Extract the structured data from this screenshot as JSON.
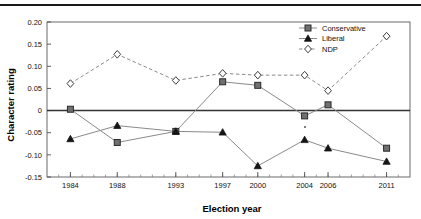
{
  "chart_data": {
    "type": "line",
    "title": "",
    "xlabel": "Election year",
    "ylabel": "Character rating",
    "categories": [
      1984,
      1988,
      1993,
      1997,
      2000,
      2004,
      2006,
      2011
    ],
    "xtick_labels": [
      "1984",
      "1988",
      "1993",
      "1997",
      "2000",
      "2004",
      "2006",
      "2011"
    ],
    "xlim": [
      1982,
      2013
    ],
    "ylim": [
      -0.15,
      0.2
    ],
    "ytick_values": [
      0.2,
      0.15,
      0.1,
      0.05,
      0,
      -0.05,
      -0.1,
      -0.15
    ],
    "ytick_labels": [
      "0.20",
      "0.15",
      "0.10",
      "0.05",
      "0",
      "-0.05",
      "-0.10",
      "-0.15"
    ],
    "grid": false,
    "zero_line": true,
    "legend_position": "top-right",
    "series": [
      {
        "name": "Conservative",
        "marker": "square",
        "line_style": "solid",
        "values": [
          0.003,
          -0.072,
          -0.047,
          0.065,
          0.057,
          -0.012,
          0.013,
          -0.085
        ]
      },
      {
        "name": "Liberal",
        "marker": "triangle",
        "line_style": "solid",
        "values": [
          -0.064,
          -0.034,
          -0.047,
          -0.049,
          -0.125,
          -0.066,
          -0.085,
          -0.115
        ]
      },
      {
        "name": "NDP",
        "marker": "diamond",
        "line_style": "dashed",
        "values": [
          0.061,
          0.127,
          0.068,
          0.084,
          0.08,
          0.08,
          0.045,
          0.168
        ]
      }
    ]
  },
  "legend": {
    "items": [
      {
        "label": "Conservative"
      },
      {
        "label": "Liberal"
      },
      {
        "label": "NDP"
      }
    ]
  },
  "colors": {
    "line": "#8a8a8a",
    "frame": "#6b6b6b",
    "zero_line": "#333333",
    "marker_square_fill": "#707070",
    "marker_triangle_fill": "#151515",
    "marker_diamond_fill": "#ffffff",
    "top_rule": "#1a1a1a"
  }
}
